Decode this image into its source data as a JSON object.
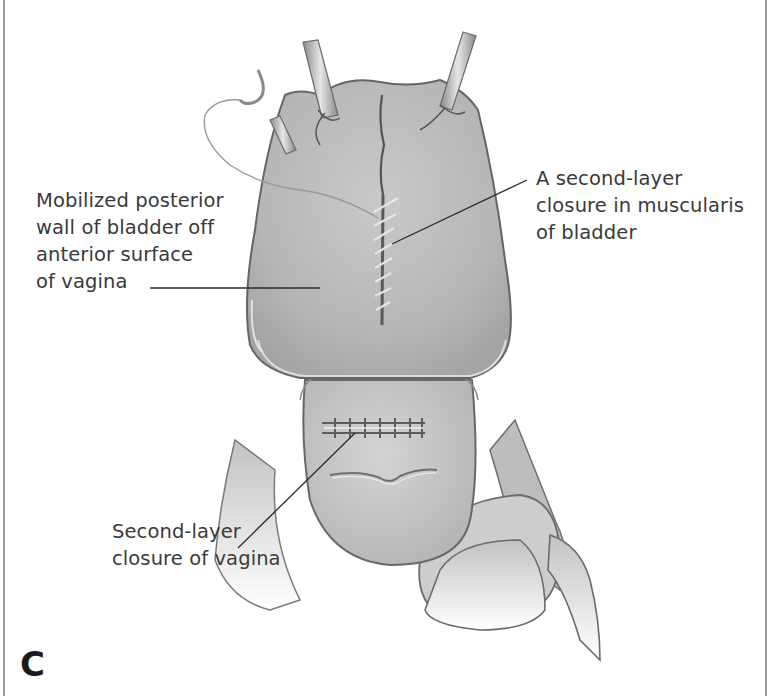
{
  "figure": {
    "panel_letter": "C",
    "labels": [
      {
        "id": "bladder-wall",
        "lines": [
          "Mobilized posterior",
          "wall of bladder off",
          "anterior surface",
          "of vagina"
        ]
      },
      {
        "id": "muscularis-closure",
        "lines": [
          "A second-layer",
          "closure in muscularis",
          "of bladder"
        ]
      },
      {
        "id": "vagina-closure",
        "lines": [
          "Second-layer",
          "closure of vagina"
        ]
      }
    ],
    "colors": {
      "tissue_fill": "#b9b9b9",
      "tissue_light": "#d6d6d6",
      "outline": "#6b6b6b",
      "suture": "#e8e8e8",
      "text": "#3a3a3a",
      "leader_line": "#2a2a2a",
      "border": "#9a9a9a"
    }
  }
}
